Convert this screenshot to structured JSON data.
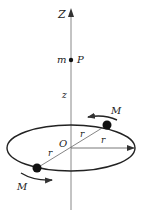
{
  "diagram": {
    "type": "physics-ring-masses",
    "colors": {
      "line": "#444444",
      "axis": "#888888",
      "mass": "#111111",
      "text": "#222222"
    },
    "labels": {
      "axis": "Z",
      "point_mass": "m",
      "point": "P",
      "height": "z",
      "origin": "O",
      "radius_1": "r",
      "radius_2": "r",
      "radius_3": "r",
      "mass_top": "M",
      "mass_bottom": "M"
    }
  }
}
